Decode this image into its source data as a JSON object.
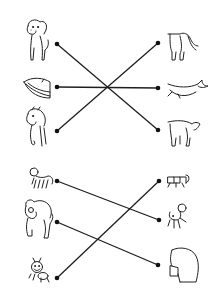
{
  "worksheet": {
    "type": "match-the-animals",
    "groups": [
      {
        "name": "group-1",
        "left": [
          {
            "animal": "dog",
            "view": "front",
            "dot": [
              57,
              44
            ]
          },
          {
            "animal": "whale",
            "view": "head",
            "dot": [
              57,
              87
            ]
          },
          {
            "animal": "horse",
            "view": "front",
            "dot": [
              57,
              131
            ]
          }
        ],
        "right": [
          {
            "animal": "horse",
            "view": "back",
            "dot": [
              158,
              43
            ]
          },
          {
            "animal": "whale",
            "view": "tail",
            "dot": [
              158,
              88
            ]
          },
          {
            "animal": "dog",
            "view": "back",
            "dot": [
              158,
              130
            ]
          }
        ],
        "connections": [
          {
            "from": 0,
            "to": 2,
            "animal": "dog"
          },
          {
            "from": 1,
            "to": 1,
            "animal": "whale"
          },
          {
            "from": 2,
            "to": 0,
            "animal": "horse"
          }
        ]
      },
      {
        "name": "group-2",
        "left": [
          {
            "animal": "shrimp",
            "view": "front",
            "dot": [
              57,
              181
            ]
          },
          {
            "animal": "bear",
            "view": "front",
            "dot": [
              57,
              222
            ]
          },
          {
            "animal": "ant",
            "view": "front",
            "dot": [
              57,
              278
            ]
          }
        ],
        "right": [
          {
            "animal": "ant",
            "view": "back",
            "dot": [
              159,
              181
            ]
          },
          {
            "animal": "shrimp",
            "view": "back",
            "dot": [
              159,
              220
            ]
          },
          {
            "animal": "bear",
            "view": "back",
            "dot": [
              158,
              265
            ]
          }
        ],
        "connections": [
          {
            "from": 0,
            "to": 1,
            "animal": "shrimp"
          },
          {
            "from": 1,
            "to": 2,
            "animal": "bear"
          },
          {
            "from": 2,
            "to": 0,
            "animal": "ant"
          }
        ]
      }
    ],
    "colors": {
      "line": "#1e1e1e",
      "dot": "#111111",
      "background": "#ffffff"
    }
  }
}
